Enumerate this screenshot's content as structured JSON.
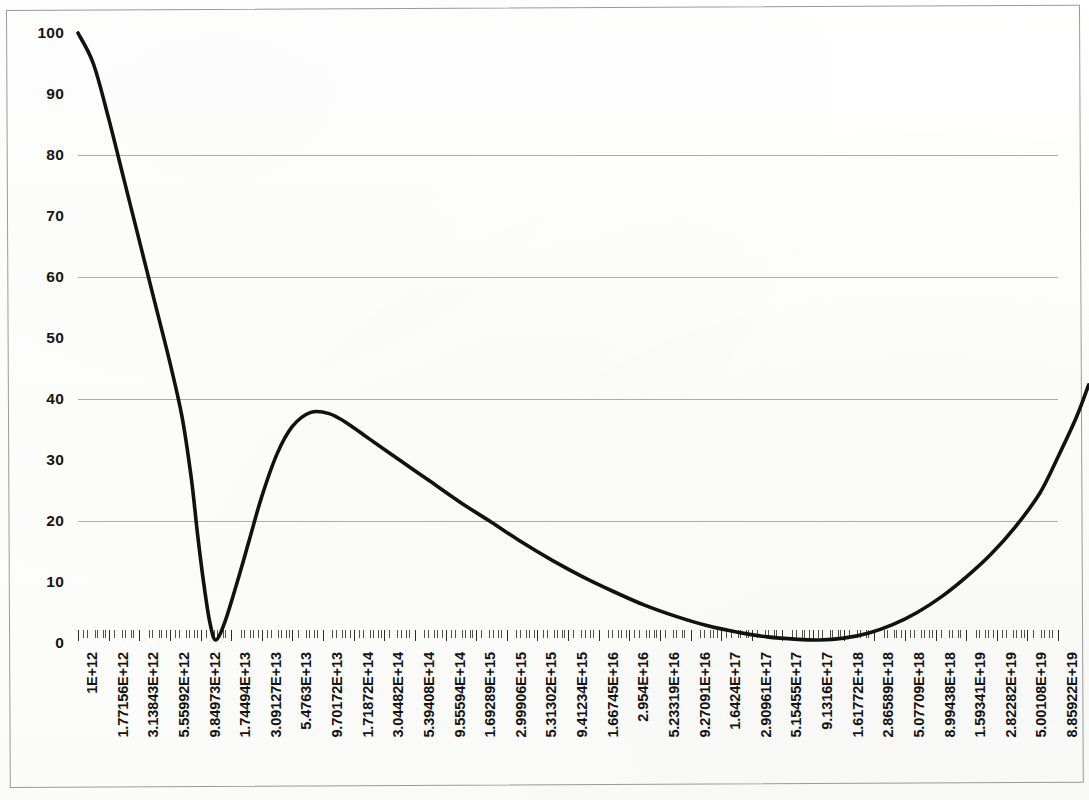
{
  "chart_data": {
    "type": "line",
    "title": "",
    "subtitle": "",
    "xlabel": "",
    "ylabel": "",
    "ylim": [
      0,
      100
    ],
    "y_ticks": [
      0,
      10,
      20,
      30,
      40,
      50,
      60,
      70,
      80,
      90,
      100
    ],
    "y_tick_labels": [
      "0",
      "10",
      "20",
      "30",
      "40",
      "50",
      "60",
      "70",
      "80",
      "90",
      "100"
    ],
    "gridlines_y": [
      20,
      40,
      60,
      80
    ],
    "grid": "horizontal-only",
    "legend": "none",
    "x_axis_scale": "log",
    "x_tick_labels": [
      "1E+12",
      "1.77156E+12",
      "3.13843E+12",
      "5.55992E+12",
      "9.84973E+12",
      "1.74494E+13",
      "3.09127E+13",
      "5.4763E+13",
      "9.70172E+13",
      "1.71872E+14",
      "3.04482E+14",
      "5.39408E+14",
      "9.55594E+14",
      "1.69289E+15",
      "2.99906E+15",
      "5.31302E+15",
      "9.41234E+15",
      "1.66745E+16",
      "2.954E+16",
      "5.23319E+16",
      "9.27091E+16",
      "1.6424E+17",
      "2.90961E+17",
      "5.15455E+17",
      "9.1316E+17",
      "1.61772E+18",
      "2.86589E+18",
      "5.07709E+18",
      "8.99438E+18",
      "1.59341E+19",
      "2.82282E+19",
      "5.00108E+19",
      "8.85922E+19"
    ],
    "series": [
      {
        "name": "curve",
        "color": "#111111",
        "points": [
          [
            0.0,
            100.0
          ],
          [
            0.5,
            95.0
          ],
          [
            1.0,
            86.0
          ],
          [
            1.5,
            76.0
          ],
          [
            2.0,
            66.0
          ],
          [
            2.5,
            56.0
          ],
          [
            3.0,
            46.0
          ],
          [
            3.4,
            37.0
          ],
          [
            3.7,
            27.0
          ],
          [
            3.9,
            18.0
          ],
          [
            4.1,
            10.0
          ],
          [
            4.3,
            3.5
          ],
          [
            4.5,
            0.5
          ],
          [
            4.8,
            3.5
          ],
          [
            5.2,
            10.0
          ],
          [
            5.6,
            17.0
          ],
          [
            6.0,
            24.0
          ],
          [
            6.5,
            31.0
          ],
          [
            7.0,
            35.5
          ],
          [
            7.6,
            37.8
          ],
          [
            8.2,
            37.6
          ],
          [
            8.8,
            36.0
          ],
          [
            9.5,
            33.5
          ],
          [
            10.5,
            30.0
          ],
          [
            11.5,
            26.5
          ],
          [
            12.5,
            23.0
          ],
          [
            13.5,
            19.8
          ],
          [
            14.5,
            16.5
          ],
          [
            15.5,
            13.5
          ],
          [
            16.5,
            10.8
          ],
          [
            17.5,
            8.4
          ],
          [
            18.5,
            6.2
          ],
          [
            19.5,
            4.4
          ],
          [
            20.5,
            2.9
          ],
          [
            21.5,
            1.8
          ],
          [
            22.5,
            1.0
          ],
          [
            23.5,
            0.6
          ],
          [
            24.2,
            0.5
          ],
          [
            25.0,
            0.8
          ],
          [
            25.8,
            1.6
          ],
          [
            26.6,
            3.0
          ],
          [
            27.4,
            5.0
          ],
          [
            28.2,
            7.6
          ],
          [
            29.0,
            10.8
          ],
          [
            29.8,
            14.5
          ],
          [
            30.6,
            19.0
          ],
          [
            31.4,
            24.5
          ],
          [
            32.0,
            30.5
          ],
          [
            32.6,
            37.0
          ],
          [
            33.0,
            42.3
          ]
        ]
      }
    ]
  },
  "chart": {
    "line_color": "#111111",
    "grid_color": "#9d9d9d",
    "frame_color": "#9a9a9a",
    "background": "#ffffff"
  }
}
